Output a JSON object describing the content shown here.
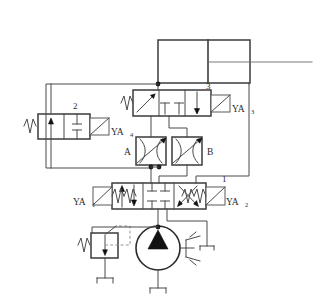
{
  "figure": {
    "type": "hydraulic-circuit-schematic",
    "title": "",
    "background_color": "#ffffff",
    "line_color": "#4a4a4a",
    "accent_color": "#111111",
    "width": 322,
    "height": 300
  },
  "labels": {
    "valve_1_number": "1",
    "valve_2_number": "2",
    "valve_3_number": "3",
    "throttle_a": "A",
    "throttle_b": "B",
    "solenoid_ya1_base": "YA",
    "solenoid_ya1_sub": "1",
    "solenoid_ya2_base": "YA",
    "solenoid_ya2_sub": "2",
    "solenoid_ya3_base": "YA",
    "solenoid_ya3_sub": "3",
    "solenoid_ya4_base": "YA",
    "solenoid_ya4_sub": "4"
  },
  "components": [
    {
      "id": "cylinder",
      "name": "double-acting-cylinder",
      "label": "",
      "kind": "actuator"
    },
    {
      "id": "valve-3",
      "name": "directional-valve-3",
      "label": "3",
      "kind": "3-position-directional-valve",
      "actuator_left": "spring",
      "actuator_right": "solenoid",
      "solenoid_label": "YA3"
    },
    {
      "id": "valve-2",
      "name": "directional-valve-2",
      "label": "2",
      "kind": "2-position-directional-valve",
      "actuator_left": "spring",
      "actuator_right": "solenoid",
      "solenoid_label": "YA4"
    },
    {
      "id": "throttle-a",
      "name": "throttle-check-valve-a",
      "label": "A",
      "kind": "adjustable-throttle-valve"
    },
    {
      "id": "throttle-b",
      "name": "throttle-check-valve-b",
      "label": "B",
      "kind": "adjustable-throttle-valve"
    },
    {
      "id": "valve-1",
      "name": "directional-valve-1",
      "label": "1",
      "kind": "3-position-4-way-directional-valve",
      "actuator_left": "solenoid-spring",
      "actuator_right": "solenoid-spring",
      "solenoid_left_label": "YA1",
      "solenoid_right_label": "YA2"
    },
    {
      "id": "relief-valve",
      "name": "pressure-relief-valve",
      "label": "",
      "kind": "pressure-relief-valve"
    },
    {
      "id": "pump",
      "name": "hydraulic-pump",
      "label": "",
      "kind": "fixed-displacement-pump"
    },
    {
      "id": "motor-drive",
      "name": "prime-mover-drive",
      "label": "",
      "kind": "drive-shaft"
    },
    {
      "id": "tank-pump",
      "name": "reservoir-pump",
      "label": "",
      "kind": "tank"
    },
    {
      "id": "tank-relief",
      "name": "reservoir-relief",
      "label": "",
      "kind": "tank"
    }
  ]
}
